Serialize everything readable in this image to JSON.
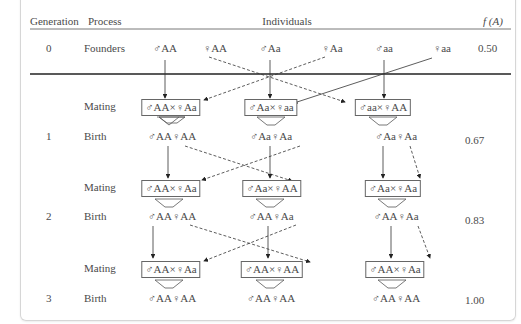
{
  "header": {
    "generation": "Generation",
    "process": "Process",
    "individuals": "Individuals",
    "freq": "f (A)"
  },
  "rows": {
    "gen0": {
      "generation": "0",
      "process": "Founders",
      "freq": "0.50",
      "individuals": [
        "♂AA",
        "♀AA",
        "♂Aa",
        "♀Aa",
        "♂aa",
        "♀aa"
      ]
    },
    "mating1": {
      "process": "Mating",
      "pairs": [
        "♂AA×♀Aa",
        "♂Aa×♀aa",
        "♂aa×♀AA"
      ]
    },
    "gen1": {
      "generation": "1",
      "process": "Birth",
      "freq": "0.67",
      "offspring": [
        "♂AA♀AA",
        "♂Aa♀Aa",
        "♂Aa♀Aa"
      ]
    },
    "mating2": {
      "process": "Mating",
      "pairs": [
        "♂AA×♀Aa",
        "♂Aa×♀AA",
        "♂Aa×♀Aa"
      ]
    },
    "gen2": {
      "generation": "2",
      "process": "Birth",
      "freq": "0.83",
      "offspring": [
        "♂AA♀AA",
        "♂AA♀Aa",
        "♂AA♀Aa"
      ]
    },
    "mating3": {
      "process": "Mating",
      "pairs": [
        "♂AA×♀Aa",
        "♂AA×♀AA",
        "♂AA×♀Aa"
      ]
    },
    "gen3": {
      "generation": "3",
      "process": "Birth",
      "freq": "1.00",
      "offspring": [
        "♂AA♀AA",
        "♂AA♀AA",
        "♂AA♀AA"
      ]
    }
  },
  "colors": {
    "line": "#333333",
    "text": "#4a4a4a",
    "border": "#d6d6d6"
  }
}
